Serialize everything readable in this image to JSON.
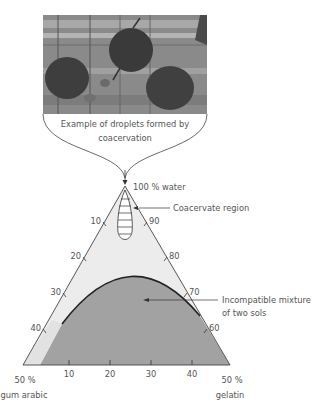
{
  "photo": {
    "caption_line1": "Example of droplets formed by",
    "caption_line2": "coacervation"
  },
  "diagram": {
    "apex_label": "100 % water",
    "coacervate_label": "Coacervate region",
    "incompatible_label_line1": "Incompatible mixture",
    "incompatible_label_line2": "of two sols",
    "left_ticks": [
      "10",
      "20",
      "30",
      "40"
    ],
    "right_ticks": [
      "90",
      "80",
      "70",
      "60"
    ],
    "bottom_ticks": [
      "10",
      "20",
      "30",
      "40"
    ],
    "bottom_left_label_line1": "50 %",
    "bottom_left_label_line2": "gum arabic",
    "bottom_right_label_line1": "50 %",
    "bottom_right_label_line2": "gelatin"
  },
  "colors": {
    "triangle_fill": "#ececec",
    "incompatible_fill": "#a2a2a2",
    "line": "#444444"
  }
}
